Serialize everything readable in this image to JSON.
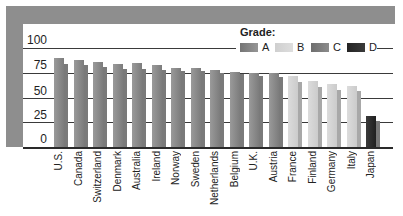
{
  "chart_data": {
    "type": "bar",
    "title": "",
    "xlabel": "",
    "ylabel": "",
    "ylim": [
      0,
      100
    ],
    "yticks": [
      0,
      25,
      50,
      75,
      100
    ],
    "grid": true,
    "legend": {
      "title": "Grade:",
      "position": "top-right",
      "entries": [
        {
          "label": "A",
          "color": "#8a8a8a"
        },
        {
          "label": "B",
          "color": "#d4d4d4"
        },
        {
          "label": "C",
          "color": "#7c7c7c"
        },
        {
          "label": "D",
          "color": "#2c2c2c"
        }
      ]
    },
    "categories": [
      "U.S.",
      "Canada",
      "Switzerland",
      "Denmark",
      "Australia",
      "Ireland",
      "Norway",
      "Sweden",
      "Netherlands",
      "Belgium",
      "U.K.",
      "Austria",
      "France",
      "Finland",
      "Germany",
      "Italy",
      "Japan"
    ],
    "grades": [
      "A",
      "A",
      "A",
      "A",
      "A",
      "A",
      "A",
      "A",
      "A",
      "A",
      "A",
      "A",
      "B",
      "B",
      "B",
      "B",
      "D"
    ],
    "series": [
      {
        "name": "front bar",
        "values": [
          90,
          88,
          86,
          84,
          85,
          83,
          80,
          80,
          78,
          76,
          75,
          75,
          72,
          67,
          64,
          62,
          32
        ]
      },
      {
        "name": "offset back bar",
        "values": [
          84,
          83,
          81,
          79,
          79,
          78,
          77,
          77,
          75,
          74,
          72,
          71,
          66,
          61,
          58,
          57,
          26
        ]
      }
    ]
  },
  "colors": {
    "frame": "#8e8e8e",
    "gridline": "#3a3a3a",
    "grade_A_back": "#7a7a7a",
    "grade_B_back": "#a8a8a8",
    "grade_C_back": "#6c6c6c",
    "grade_D_back": "#777777"
  }
}
